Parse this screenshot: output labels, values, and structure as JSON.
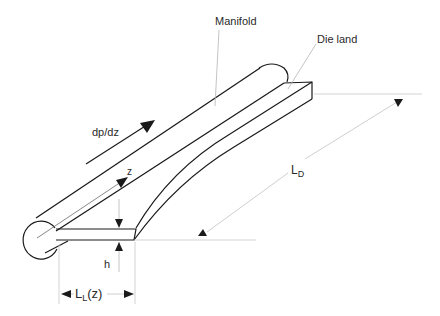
{
  "figure": {
    "type": "coat-hanger die schematic (isometric)",
    "labels": {
      "manifold": "Manifold",
      "die_land": "Die land",
      "pressure_gradient": "dp/dz",
      "axis_z": "z",
      "die_width_main": "L",
      "die_width_sub": "D",
      "gap_height": "h",
      "land_length_main": "L",
      "land_length_sub": "L",
      "land_length_arg": "(z)"
    },
    "colors": {
      "outline": "#1a1a1a",
      "leader_line": "#b5b5b5",
      "dimension_line": "#c8c8c8",
      "text": "#2a2a2a",
      "background": "#ffffff"
    }
  }
}
